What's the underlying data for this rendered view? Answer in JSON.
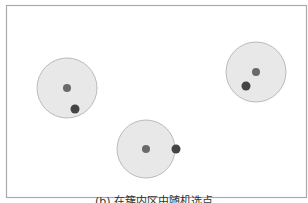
{
  "figure": {
    "caption": "(b) 在簇内区由随机选点",
    "frame": {
      "x": 6.5,
      "y": 5.5,
      "width": 300,
      "height": 192,
      "stroke": "#aaaaaa"
    },
    "cluster_style": {
      "fill": "#e8e8e8",
      "stroke": "#bbbbbb"
    },
    "center_dot_color": "#6a6a6a",
    "sample_dot_color": "#444444",
    "clusters": [
      {
        "id": "cluster-1",
        "cx": 67,
        "cy": 88,
        "r": 30,
        "center": {
          "x": 67,
          "y": 88,
          "r": 4
        },
        "sample": {
          "x": 75,
          "y": 109,
          "r": 4.5
        }
      },
      {
        "id": "cluster-2",
        "cx": 146,
        "cy": 149,
        "r": 29,
        "center": {
          "x": 146,
          "y": 149,
          "r": 4
        },
        "sample": {
          "x": 176,
          "y": 149,
          "r": 4.5
        }
      },
      {
        "id": "cluster-3",
        "cx": 256,
        "cy": 72,
        "r": 30,
        "center": {
          "x": 256,
          "y": 72,
          "r": 4
        },
        "sample": {
          "x": 246,
          "y": 86,
          "r": 4.5
        }
      }
    ]
  }
}
